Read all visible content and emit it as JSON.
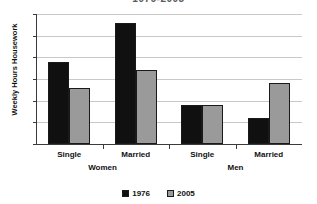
{
  "chart_data": {
    "type": "bar",
    "title": "1976-2005",
    "xlabel": "",
    "ylabel": "Weekly Hours Housework",
    "ylim": [
      0,
      30
    ],
    "yticks": [
      0,
      5,
      10,
      15,
      20,
      25,
      30
    ],
    "grid": true,
    "legend_position": "bottom",
    "categories": [
      "Single",
      "Married",
      "Single",
      "Married"
    ],
    "groups": [
      {
        "label": "Women",
        "categories": [
          "Single",
          "Married"
        ]
      },
      {
        "label": "Men",
        "categories": [
          "Single",
          "Married"
        ]
      }
    ],
    "series": [
      {
        "name": "1976",
        "color": "#101010",
        "values": [
          19,
          28,
          9,
          6
        ]
      },
      {
        "name": "2005",
        "color": "#9a9a9a",
        "values": [
          13,
          17,
          9,
          14
        ]
      }
    ]
  }
}
